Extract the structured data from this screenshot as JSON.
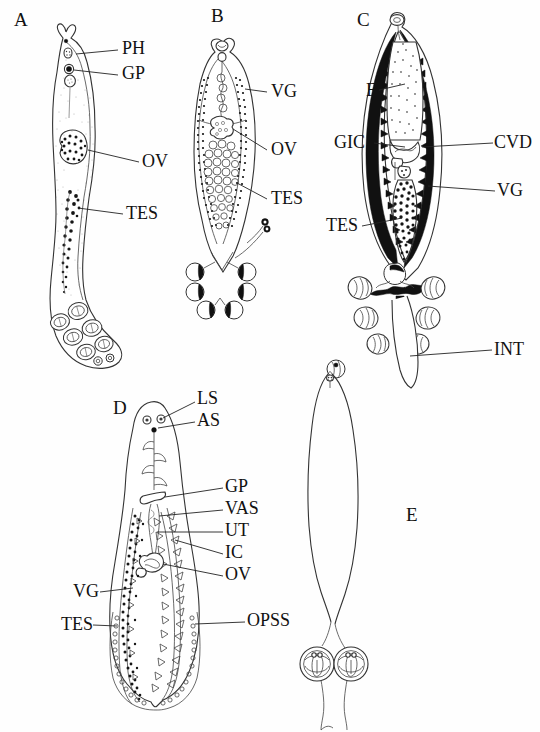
{
  "figure": {
    "type": "scientific-line-drawing-plate",
    "background_color": "#ffffff",
    "ink_color": "#111111",
    "panel_count": 5
  },
  "panels": [
    {
      "letter": "A",
      "letter_pos": {
        "x": 14,
        "y": 18
      },
      "description": "Elongate stippled body, tapering anterior end with pharynx and genital pore, median ovary, follicular testes, posterior opisthaptor bearing eight clamps in two rows plus small terminal hooks",
      "labels": [
        {
          "text": "PH",
          "x": 122,
          "y": 46,
          "meaning": "pharynx"
        },
        {
          "text": "GP",
          "x": 122,
          "y": 71,
          "meaning": "genital pore"
        },
        {
          "text": "OV",
          "x": 143,
          "y": 160,
          "meaning": "ovary"
        },
        {
          "text": "TES",
          "x": 127,
          "y": 212,
          "meaning": "testes"
        }
      ],
      "clamp_count": 8
    },
    {
      "letter": "B",
      "letter_pos": {
        "x": 211,
        "y": 14
      },
      "description": "Lanceolate body with dotted lateral vitelline fields, lobed ovary, rosette of globular testes, haptor with six clamps in two columns and a small lateral appendix",
      "labels": [
        {
          "text": "VG",
          "x": 271,
          "y": 89,
          "meaning": "vitelline glands"
        },
        {
          "text": "OV",
          "x": 271,
          "y": 147,
          "meaning": "ovary"
        },
        {
          "text": "TES",
          "x": 271,
          "y": 196,
          "meaning": "testes"
        }
      ],
      "clamp_count": 6
    },
    {
      "letter": "C",
      "letter_pos": {
        "x": 357,
        "y": 18
      },
      "description": "Body with dense black marginal vitellaria, pale median egg-filled uterus, genito-intestinal canal, common vitelline duct, granular testis mass; haptor with six clamps flanking a dark intestinal trunk",
      "labels": [
        {
          "text": "E",
          "x": 369,
          "y": 88,
          "meaning": "egg"
        },
        {
          "text": "GIC",
          "x": 337,
          "y": 140,
          "meaning": "genito-intestinal canal"
        },
        {
          "text": "CVD",
          "x": 493,
          "y": 140,
          "meaning": "common vitelline duct"
        },
        {
          "text": "VG",
          "x": 497,
          "y": 188,
          "meaning": "vitelline glands"
        },
        {
          "text": "TES",
          "x": 330,
          "y": 223,
          "meaning": "testes"
        },
        {
          "text": "INT",
          "x": 494,
          "y": 347,
          "meaning": "intestine"
        }
      ],
      "clamp_count": 6
    },
    {
      "letter": "D",
      "letter_pos": {
        "x": 116,
        "y": 406
      },
      "description": "Pyriform body with paired lateral suckers and anterior sucker, median genital pore, vas deferens, uterus, intestinal caeca, ovary, extensive granular vitellaria and testes, marginal row of opisthaptoral suckers",
      "labels": [
        {
          "text": "LS",
          "x": 199,
          "y": 397,
          "meaning": "lateral sucker"
        },
        {
          "text": "AS",
          "x": 199,
          "y": 419,
          "meaning": "anterior sucker"
        },
        {
          "text": "GP",
          "x": 226,
          "y": 485,
          "meaning": "genital pore"
        },
        {
          "text": "VAS",
          "x": 226,
          "y": 506,
          "meaning": "vas deferens"
        },
        {
          "text": "UT",
          "x": 226,
          "y": 528,
          "meaning": "uterus"
        },
        {
          "text": "IC",
          "x": 226,
          "y": 550,
          "meaning": "intestinal caeca"
        },
        {
          "text": "OV",
          "x": 226,
          "y": 572,
          "meaning": "ovary"
        },
        {
          "text": "VG",
          "x": 78,
          "y": 589,
          "meaning": "vitelline glands"
        },
        {
          "text": "TES",
          "x": 66,
          "y": 622,
          "meaning": "testes"
        },
        {
          "text": "OPSS",
          "x": 249,
          "y": 618,
          "meaning": "opisthaptoral suckers"
        }
      ]
    },
    {
      "letter": "E",
      "letter_pos": {
        "x": 408,
        "y": 515
      },
      "description": "Slender unlabelled outline of body narrowing into a peduncle bearing two large circular clamps with internal sclerites and paired terminal filaments",
      "labels": [],
      "clamp_count": 2
    }
  ],
  "abbreviation_key": {
    "PH": "pharynx",
    "GP": "genital pore",
    "OV": "ovary",
    "TES": "testes",
    "VG": "vitelline glands",
    "E": "egg",
    "GIC": "genito-intestinal canal",
    "CVD": "common vitelline duct",
    "INT": "intestine",
    "LS": "lateral sucker",
    "AS": "anterior sucker",
    "VAS": "vas deferens",
    "UT": "uterus",
    "IC": "intestinal caeca",
    "OPSS": "opisthaptoral suckers"
  }
}
